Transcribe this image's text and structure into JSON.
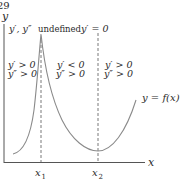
{
  "page_number": "29",
  "axes": {
    "y_label": "y",
    "x_label": "x",
    "color": "#555555"
  },
  "markers": {
    "x1": "x",
    "x1_sub": "1",
    "x2": "x",
    "x2_sub": "2"
  },
  "annotations": {
    "cusp": {
      "vars": "y′, y″",
      "text": "undefined"
    },
    "stationary": "y′ = 0",
    "region_left": {
      "line1": "y′ > 0",
      "line2": "y″ > 0"
    },
    "region_middle": {
      "line1": "y′ < 0",
      "line2": "y″ > 0"
    },
    "region_right": {
      "line1": "y′ > 0",
      "line2": "y″ > 0"
    }
  },
  "curve": {
    "label": "y = f(x)",
    "color": "#8a8a8a"
  }
}
